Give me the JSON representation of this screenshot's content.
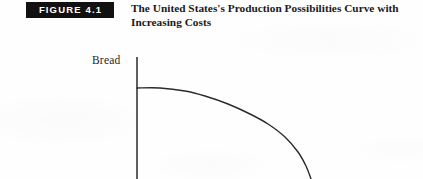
{
  "figure": {
    "badge_label": "FIGURE 4.1",
    "badge_bg_color": "#111111",
    "badge_text_color": "#ffffff",
    "caption_lines": [
      "The United States's Production Possibilities Curve with",
      "Increasing Costs"
    ],
    "caption_color": "#1a1a1a"
  },
  "page": {
    "background_color": "#fefefe"
  },
  "chart_data": {
    "type": "line",
    "title": "The United States's Production Possibilities Curve with Increasing Costs",
    "ylabel": "Bread",
    "xlabel": "",
    "grid": false,
    "legend": null,
    "axis_color": "#2a2a2a",
    "curve_color": "#2a2a2a",
    "axis": {
      "y_axis_x": 137,
      "y_axis_top": 57,
      "y_axis_bottom": 179,
      "x_axis_visible": false
    },
    "series": [
      {
        "name": "Production Possibilities Curve",
        "shape": "concave-to-origin",
        "points": [
          [
            137,
            88
          ],
          [
            160,
            88
          ],
          [
            185,
            91
          ],
          [
            205,
            96
          ],
          [
            228,
            104
          ],
          [
            250,
            114
          ],
          [
            268,
            124
          ],
          [
            285,
            137
          ],
          [
            298,
            152
          ],
          [
            306,
            166
          ],
          [
            311,
            179
          ]
        ]
      }
    ],
    "annotations": []
  }
}
